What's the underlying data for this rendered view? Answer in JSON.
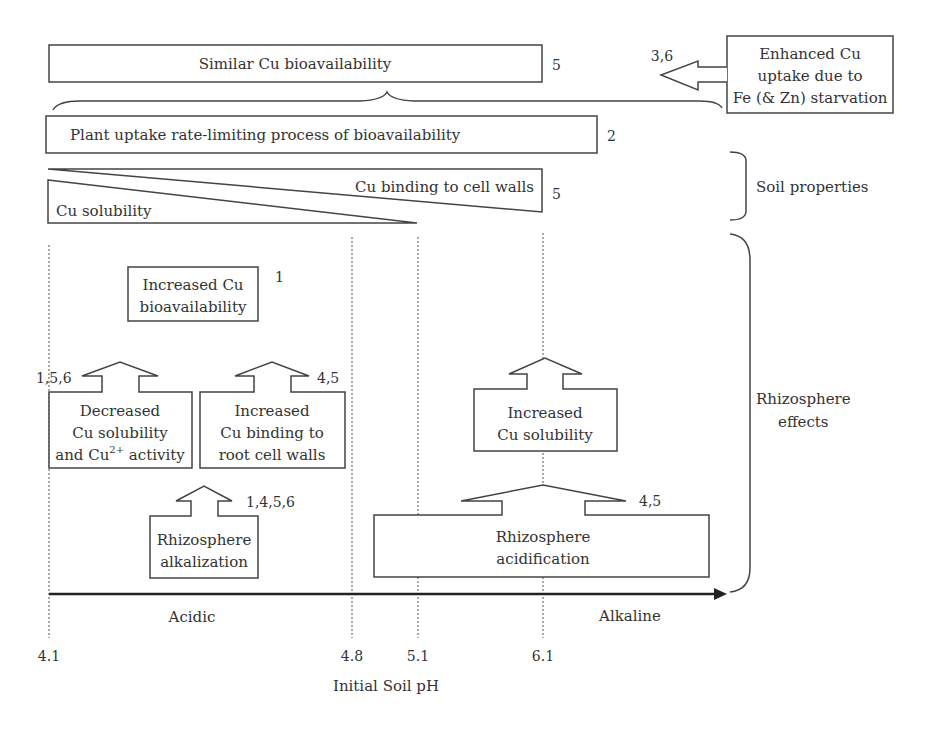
{
  "top": {
    "similar_bioavailability": "Similar Cu bioavailability",
    "similar_ref": "5",
    "enhanced_uptake": [
      "Enhanced Cu",
      "uptake due to",
      "Fe (& Zn) starvation"
    ],
    "enhanced_ref": "3,6",
    "plant_uptake": "Plant uptake rate-limiting process of bioavailability",
    "plant_uptake_ref": "2"
  },
  "soil": {
    "cu_binding": "Cu binding to cell walls",
    "cu_binding_ref": "5",
    "cu_solubility": "Cu solubility",
    "label": "Soil properties"
  },
  "rhizosphere": {
    "label_line1": "Rhizosphere",
    "label_line2": "effects",
    "increased_bio_line1": "Increased Cu",
    "increased_bio_line2": "bioavailability",
    "increased_bio_ref": "1",
    "decreased_sol_line1": "Decreased",
    "decreased_sol_line2": "Cu solubility",
    "decreased_sol_line3_pre": "and Cu",
    "decreased_sol_line3_sup": "2+",
    "decreased_sol_line3_post": " activity",
    "decreased_sol_ref": "1,5,6",
    "increased_binding_line1": "Increased",
    "increased_binding_line2": "Cu binding to",
    "increased_binding_line3": "root cell walls",
    "increased_binding_ref": "4,5",
    "alkalization_line1": "Rhizosphere",
    "alkalization_line2": "alkalization",
    "alkalization_ref": "1,4,5,6",
    "increased_sol_line1": "Increased",
    "increased_sol_line2": "Cu solubility",
    "acidification_line1": "Rhizosphere",
    "acidification_line2": "acidification",
    "acidification_ref": "4,5"
  },
  "axis": {
    "acidic": "Acidic",
    "alkaline": "Alkaline",
    "ticks": [
      "4.1",
      "4.8",
      "5.1",
      "6.1"
    ],
    "title": "Initial Soil pH"
  }
}
